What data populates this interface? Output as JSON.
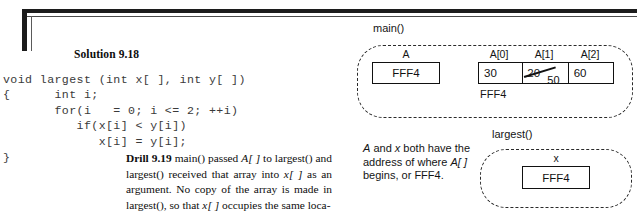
{
  "page": {
    "solution_heading": "Solution 9.18",
    "code": "void largest (int x[ ], int y[ ])\n{      int i;\n       for(i   = 0; i <= 2; ++i)\n          if(x[i] < y[i])\n             x[i] = y[i];\n}"
  },
  "drill": {
    "label": "Drill 9.19",
    "text_1": " main() passed ",
    "italic_1": "A[ ]",
    "text_2": " to largest() and largest() received that array into ",
    "italic_2": "x[ ]",
    "text_3": " as an argument. No copy of the array is made in largest(), so that ",
    "italic_3": "x[ ]",
    "text_4": " occupies the same loca-"
  },
  "diagram": {
    "main_scope": {
      "label": "main()",
      "pointer_var": {
        "name": "A",
        "value": "FFF4"
      },
      "array": {
        "cell_labels": [
          "A[0]",
          "A[1]",
          "A[2]"
        ],
        "cell_values": [
          "30",
          "20",
          "60"
        ],
        "cell_0_value": "30",
        "cell_1_old_value": "20",
        "cell_1_new_value": "50",
        "cell_2_value": "60",
        "base_address": "FFF4"
      }
    },
    "largest_scope": {
      "label": "largest()",
      "pointer_var": {
        "name": "x",
        "value": "FFF4"
      }
    },
    "explanation": {
      "line_1_a": "A",
      "line_1_b": " and ",
      "line_1_c": "x",
      "line_1_d": " both have",
      "line_2": "the address of",
      "line_3_a": "where ",
      "line_3_b": "A[ ]",
      "line_3_c": " begins,",
      "line_4": "or FFF4."
    }
  },
  "colors": {
    "ink": "#111111",
    "code_ink": "#3a3a3a",
    "frame": "#1c1c1c",
    "paper": "#ffffff"
  }
}
